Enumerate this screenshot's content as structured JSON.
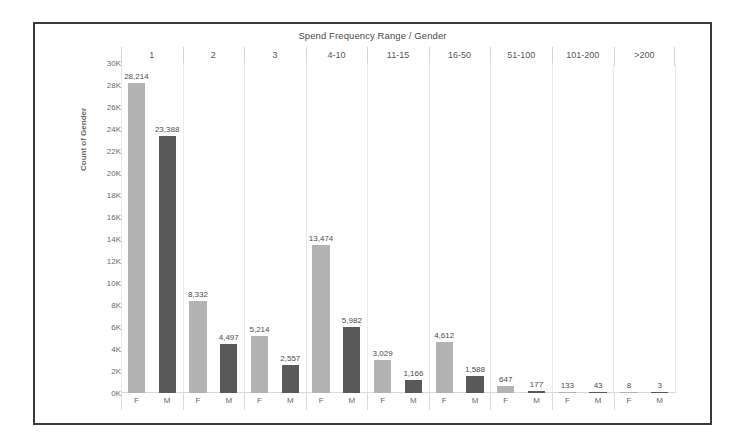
{
  "chart_data": {
    "type": "bar",
    "title": "Spend Frequency Range / Gender",
    "xlabel": "Spend Frequency Range / Gender",
    "ylabel": "Count of Gender",
    "ylim": [
      0,
      30000
    ],
    "ytick_labels": [
      "30K",
      "28K",
      "26K",
      "24K",
      "22K",
      "20K",
      "18K",
      "16K",
      "14K",
      "12K",
      "10K",
      "8K",
      "6K",
      "4K",
      "2K",
      "0K"
    ],
    "ytick_values": [
      30000,
      28000,
      26000,
      24000,
      22000,
      20000,
      18000,
      16000,
      14000,
      12000,
      10000,
      8000,
      6000,
      4000,
      2000,
      0
    ],
    "grid": "vertical-only",
    "legend": "none",
    "categories": [
      "1",
      "2",
      "3",
      "4-10",
      "11-15",
      "16-50",
      "51-100",
      "101-200",
      ">200"
    ],
    "subcategories": [
      "F",
      "M"
    ],
    "series": [
      {
        "name": "F",
        "color": "#b3b3b3",
        "values": [
          28214,
          8332,
          5214,
          13474,
          3029,
          4612,
          647,
          133,
          8
        ]
      },
      {
        "name": "M",
        "color": "#595959",
        "values": [
          23388,
          4497,
          2557,
          5982,
          1166,
          1588,
          177,
          43,
          3
        ]
      }
    ],
    "data_labels": {
      "1": {
        "F": "28,214",
        "M": "23,388"
      },
      "2": {
        "F": "8,332",
        "M": "4,497"
      },
      "3": {
        "F": "5,214",
        "M": "2,557"
      },
      "4-10": {
        "F": "13,474",
        "M": "5,982"
      },
      "11-15": {
        "F": "3,029",
        "M": "1,166"
      },
      "16-50": {
        "F": "4,612",
        "M": "1,588"
      },
      "51-100": {
        "F": "647",
        "M": "177"
      },
      "101-200": {
        "F": "133",
        "M": "43"
      },
      ">200": {
        "F": "8",
        "M": "3"
      }
    },
    "bars": [
      {
        "category": "1",
        "gender": "F",
        "value": 28214,
        "label": "28,214",
        "color": "#b3b3b3"
      },
      {
        "category": "1",
        "gender": "M",
        "value": 23388,
        "label": "23,388",
        "color": "#595959"
      },
      {
        "category": "2",
        "gender": "F",
        "value": 8332,
        "label": "8,332",
        "color": "#b3b3b3"
      },
      {
        "category": "2",
        "gender": "M",
        "value": 4497,
        "label": "4,497",
        "color": "#595959"
      },
      {
        "category": "3",
        "gender": "F",
        "value": 5214,
        "label": "5,214",
        "color": "#b3b3b3"
      },
      {
        "category": "3",
        "gender": "M",
        "value": 2557,
        "label": "2,557",
        "color": "#595959"
      },
      {
        "category": "4-10",
        "gender": "F",
        "value": 13474,
        "label": "13,474",
        "color": "#b3b3b3"
      },
      {
        "category": "4-10",
        "gender": "M",
        "value": 5982,
        "label": "5,982",
        "color": "#595959"
      },
      {
        "category": "11-15",
        "gender": "F",
        "value": 3029,
        "label": "3,029",
        "color": "#b3b3b3"
      },
      {
        "category": "11-15",
        "gender": "M",
        "value": 1166,
        "label": "1,166",
        "color": "#595959"
      },
      {
        "category": "16-50",
        "gender": "F",
        "value": 4612,
        "label": "4,612",
        "color": "#b3b3b3"
      },
      {
        "category": "16-50",
        "gender": "M",
        "value": 1588,
        "label": "1,588",
        "color": "#595959"
      },
      {
        "category": "51-100",
        "gender": "F",
        "value": 647,
        "label": "647",
        "color": "#b3b3b3"
      },
      {
        "category": "51-100",
        "gender": "M",
        "value": 177,
        "label": "177",
        "color": "#595959"
      },
      {
        "category": "101-200",
        "gender": "F",
        "value": 133,
        "label": "133",
        "color": "#b3b3b3"
      },
      {
        "category": "101-200",
        "gender": "M",
        "value": 43,
        "label": "43",
        "color": "#595959"
      },
      {
        "category": ">200",
        "gender": "F",
        "value": 8,
        "label": "8",
        "color": "#b3b3b3"
      },
      {
        "category": ">200",
        "gender": "M",
        "value": 3,
        "label": "3",
        "color": "#595959"
      }
    ]
  }
}
